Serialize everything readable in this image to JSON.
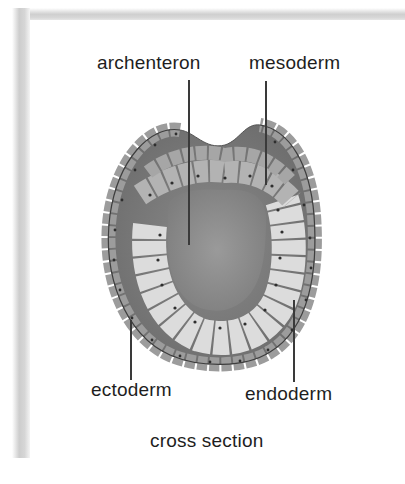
{
  "figure": {
    "labels": {
      "archenteron": "archenteron",
      "mesoderm": "mesoderm",
      "ectoderm": "ectoderm",
      "endoderm": "endoderm"
    },
    "caption": "cross section"
  },
  "colors": {
    "cavity": "#8f8f8f",
    "ectoderm_cell": "#9a9a9a",
    "mesoderm_cell": "#a8a8a8",
    "endoderm_cell": "#d8d8d8",
    "outline": "#4a4a4a",
    "text": "#1e1e1e"
  }
}
